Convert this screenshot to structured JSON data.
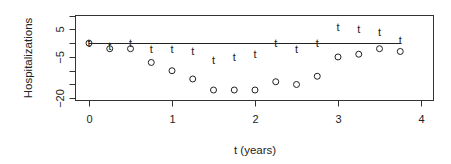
{
  "chart_data": {
    "type": "scatter",
    "title": "",
    "xlabel": "t (years)",
    "ylabel": "Hospitalizations",
    "xlim": [
      -0.17,
      4.13
    ],
    "ylim": [
      -20.6,
      10
    ],
    "x_ticks": [
      0,
      1,
      2,
      3,
      4
    ],
    "x_tick_labels": [
      "0",
      "1",
      "2",
      "3",
      "4"
    ],
    "y_ticks": [
      10,
      5,
      0,
      -5,
      -10,
      -15,
      -20
    ],
    "y_tick_labels": [
      "",
      "5",
      "",
      "-5",
      "",
      "",
      "-20"
    ],
    "grid": false,
    "x": [
      0,
      0.25,
      0.5,
      0.75,
      1.0,
      1.25,
      1.5,
      1.75,
      2.0,
      2.25,
      2.5,
      2.75,
      3.0,
      3.25,
      3.5,
      3.75
    ],
    "series": [
      {
        "name": "o",
        "marker": "circle",
        "values": [
          0,
          -2,
          -2,
          -7,
          -10,
          -13,
          -17,
          -17,
          -17,
          -14,
          -15,
          -12,
          -5,
          -4,
          -2,
          -3
        ]
      },
      {
        "name": "t",
        "marker": "t",
        "values": [
          0,
          -1,
          0,
          -2,
          -2,
          -3,
          -6,
          -5,
          -4,
          0,
          -2,
          0,
          6,
          5,
          4,
          1
        ]
      }
    ],
    "reference_line": {
      "y": 0,
      "x_from": 0,
      "x_to": 3.75
    }
  }
}
